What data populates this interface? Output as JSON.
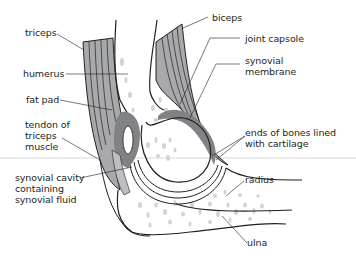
{
  "diagram": {
    "colors": {
      "muscle": "#a7a9ac",
      "capsule": "#808285",
      "bone_speckle": "#d1d3d4",
      "outline": "#231f20",
      "divider": "#d9d9d9",
      "background": "#ffffff"
    },
    "labels": {
      "triceps": "triceps",
      "humerus": "humerus",
      "fat_pad": "fat pad",
      "tendon_of_triceps": "tendon of\ntriceps\nmuscle",
      "synovial_cavity": "synovial cavity\ncontaining\nsynovial fluid",
      "biceps": "biceps",
      "joint_capsule": "joint capsole",
      "synovial_membrane": "synovial\nmembrane",
      "ends_of_bones": "ends of bones lined\nwith cartilage",
      "radius": "radius",
      "ulna": "ulna"
    }
  }
}
